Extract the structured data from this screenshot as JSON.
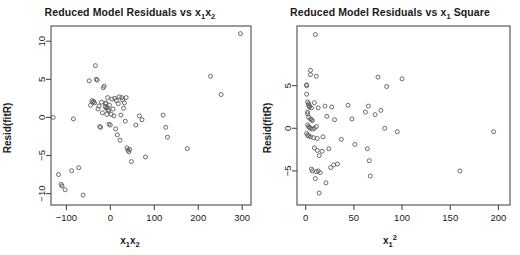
{
  "figure": {
    "width": 520,
    "height": 255,
    "background": "#ffffff",
    "point_color": "#5a5a5a",
    "axis_color": "#4a4a4a",
    "text_color": "#1a1a1a"
  },
  "chart_data": [
    {
      "type": "scatter",
      "panel": "left",
      "title": "Reduced Model Residuals vs x1x2",
      "title_parts": {
        "prefix": "Reduced Model Residuals vs ",
        "var": "x",
        "sub1": "1",
        "var2": "x",
        "sub2": "2"
      },
      "xlabel": "x1x2",
      "ylabel": "Resid(fitR)",
      "xlim": [
        -135,
        320
      ],
      "ylim": [
        -11.5,
        12.0
      ],
      "xticks": [
        -100,
        0,
        100,
        200,
        300
      ],
      "xticklabels": [
        "-100",
        "0",
        "100",
        "200",
        "300"
      ],
      "yticks": [
        -10,
        -5,
        0,
        5,
        10
      ],
      "yticklabels": [
        "-10",
        "-5",
        "0",
        "5",
        "10"
      ],
      "grid": false,
      "legend": "none",
      "marker": "open-circle",
      "points": [
        [
          -130,
          0.0
        ],
        [
          -118,
          -7.5
        ],
        [
          -112,
          -8.8
        ],
        [
          -110,
          -9.0
        ],
        [
          -103,
          -9.5
        ],
        [
          -88,
          -7.0
        ],
        [
          -84,
          -0.2
        ],
        [
          -72,
          -6.6
        ],
        [
          -62,
          -10.2
        ],
        [
          -48,
          4.8
        ],
        [
          -45,
          1.6
        ],
        [
          -42,
          2.2
        ],
        [
          -40,
          2.0
        ],
        [
          -38,
          2.1
        ],
        [
          -36,
          1.9
        ],
        [
          -34,
          6.8
        ],
        [
          -32,
          5.0
        ],
        [
          -30,
          4.9
        ],
        [
          -28,
          1.1
        ],
        [
          -26,
          1.5
        ],
        [
          -24,
          -1.2
        ],
        [
          -22,
          -1.3
        ],
        [
          -20,
          2.0
        ],
        [
          -18,
          0.6
        ],
        [
          -16,
          3.9
        ],
        [
          -14,
          4.1
        ],
        [
          -12,
          1.4
        ],
        [
          -11,
          1.8
        ],
        [
          -10,
          1.9
        ],
        [
          -9,
          1.2
        ],
        [
          -8,
          0.4
        ],
        [
          -7,
          1.3
        ],
        [
          -6,
          2.6
        ],
        [
          -5,
          1.0
        ],
        [
          -4,
          0.9
        ],
        [
          -3,
          -0.9
        ],
        [
          -2,
          1.6
        ],
        [
          0,
          -1.0
        ],
        [
          2,
          0.4
        ],
        [
          4,
          2.4
        ],
        [
          6,
          1.1
        ],
        [
          8,
          0.2
        ],
        [
          10,
          2.5
        ],
        [
          12,
          -1.5
        ],
        [
          14,
          2.2
        ],
        [
          16,
          -2.3
        ],
        [
          18,
          1.8
        ],
        [
          20,
          2.7
        ],
        [
          22,
          -3.0
        ],
        [
          24,
          0.3
        ],
        [
          26,
          2.6
        ],
        [
          28,
          2.3
        ],
        [
          30,
          1.2
        ],
        [
          32,
          1.9
        ],
        [
          34,
          -0.5
        ],
        [
          36,
          2.6
        ],
        [
          38,
          -4.0
        ],
        [
          40,
          -4.3
        ],
        [
          42,
          -4.5
        ],
        [
          44,
          -4.2
        ],
        [
          48,
          -5.8
        ],
        [
          58,
          -1.0
        ],
        [
          66,
          0.2
        ],
        [
          72,
          -0.3
        ],
        [
          80,
          -5.2
        ],
        [
          120,
          0.3
        ],
        [
          126,
          -1.3
        ],
        [
          130,
          -2.6
        ],
        [
          175,
          -4.1
        ],
        [
          228,
          5.4
        ],
        [
          252,
          3.0
        ],
        [
          296,
          11.0
        ]
      ]
    },
    {
      "type": "scatter",
      "panel": "right",
      "title": "Reduced Model Residuals vs x1 Square",
      "title_parts": {
        "prefix": "Reduced Model Residuals vs ",
        "var": "x",
        "sub1": "1",
        "suffix": " Square"
      },
      "xlabel": "x1^2",
      "ylabel": "Resid(fitR)",
      "xlim": [
        -9,
        212
      ],
      "ylim": [
        -9.0,
        12.0
      ],
      "xticks": [
        0,
        50,
        100,
        150,
        200
      ],
      "xticklabels": [
        "0",
        "50",
        "100",
        "150",
        "200"
      ],
      "yticks": [
        -5,
        0,
        5
      ],
      "yticklabels": [
        "-5",
        "0",
        "5"
      ],
      "grid": false,
      "legend": "none",
      "marker": "open-circle",
      "points": [
        [
          10,
          11.0
        ],
        [
          5,
          6.8
        ],
        [
          5,
          6.3
        ],
        [
          11,
          6.1
        ],
        [
          1,
          5.0
        ],
        [
          1,
          5.1
        ],
        [
          1,
          4.0
        ],
        [
          2,
          3.1
        ],
        [
          3,
          2.9
        ],
        [
          3,
          2.7
        ],
        [
          4,
          2.6
        ],
        [
          4,
          2.5
        ],
        [
          6,
          2.4
        ],
        [
          9,
          3.0
        ],
        [
          13,
          2.4
        ],
        [
          2,
          1.9
        ],
        [
          2,
          1.7
        ],
        [
          3,
          1.3
        ],
        [
          5,
          1.1
        ],
        [
          6,
          1.0
        ],
        [
          7,
          0.9
        ],
        [
          2,
          0.4
        ],
        [
          3,
          0.2
        ],
        [
          4,
          0.1
        ],
        [
          5,
          0.0
        ],
        [
          7,
          -0.1
        ],
        [
          9,
          0.0
        ],
        [
          11,
          0.2
        ],
        [
          1,
          -0.6
        ],
        [
          2,
          -0.8
        ],
        [
          3,
          -0.9
        ],
        [
          5,
          -1.0
        ],
        [
          8,
          -1.1
        ],
        [
          12,
          -1.2
        ],
        [
          18,
          -1.0
        ],
        [
          20,
          2.6
        ],
        [
          22,
          1.4
        ],
        [
          27,
          2.5
        ],
        [
          30,
          1.0
        ],
        [
          37,
          -1.3
        ],
        [
          44,
          2.7
        ],
        [
          48,
          1.1
        ],
        [
          51,
          -1.9
        ],
        [
          62,
          1.9
        ],
        [
          64,
          -2.4
        ],
        [
          65,
          2.6
        ],
        [
          66,
          -3.8
        ],
        [
          67,
          -5.6
        ],
        [
          72,
          1.6
        ],
        [
          75,
          6.0
        ],
        [
          78,
          2.1
        ],
        [
          82,
          0.0
        ],
        [
          84,
          4.9
        ],
        [
          95,
          -0.4
        ],
        [
          100,
          5.8
        ],
        [
          9,
          -2.3
        ],
        [
          12,
          -2.6
        ],
        [
          14,
          -3.2
        ],
        [
          17,
          -2.7
        ],
        [
          24,
          -2.4
        ],
        [
          26,
          -4.6
        ],
        [
          29,
          -4.3
        ],
        [
          33,
          -4.2
        ],
        [
          6,
          -4.8
        ],
        [
          7,
          -5.0
        ],
        [
          11,
          -5.1
        ],
        [
          13,
          -5.0
        ],
        [
          15,
          -5.2
        ],
        [
          10,
          -5.9
        ],
        [
          21,
          -6.4
        ],
        [
          14,
          -7.6
        ],
        [
          160,
          -5.0
        ],
        [
          195,
          -0.4
        ]
      ]
    }
  ]
}
